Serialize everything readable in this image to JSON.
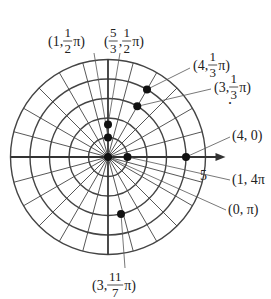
{
  "diagram": {
    "type": "polar-grid",
    "center": {
      "x": 108,
      "y": 157
    },
    "unit_px": 19.5,
    "rings": [
      1,
      2,
      3,
      4,
      5
    ],
    "ray_step_deg": 15,
    "axis_label": "5",
    "colors": {
      "grid": "#444444",
      "axis": "#333333",
      "point": "#111111",
      "text": "#222222"
    }
  },
  "points": [
    {
      "id": "p-1-half-pi",
      "r": 1,
      "theta_deg": 90,
      "label_parts": [
        "(1, ",
        "1",
        "2",
        " π)"
      ],
      "label_x": 48,
      "label_y": 46,
      "anchor": "start",
      "leader_from": [
        94,
        53
      ]
    },
    {
      "id": "p-5-3-half-pi",
      "r": 1.6667,
      "theta_deg": 90,
      "label_parts": [
        "(",
        "5",
        "3",
        ", ",
        "1",
        "2",
        "π)"
      ],
      "label_x": 104,
      "label_y": 46,
      "anchor": "start",
      "leader_from": [
        120,
        53
      ]
    },
    {
      "id": "p-4-third-pi",
      "r": 4,
      "theta_deg": 60,
      "label_parts": [
        "(4, ",
        "1",
        "3",
        "π)"
      ],
      "label_x": 193,
      "label_y": 70,
      "anchor": "start",
      "leader_from": [
        190,
        68
      ]
    },
    {
      "id": "p-3-third-pi",
      "r": 3,
      "theta_deg": 60,
      "label_parts": [
        "(3, ",
        "1",
        "3",
        "π)"
      ],
      "label_x": 214,
      "label_y": 92,
      "anchor": "start",
      "leader_from": [
        211,
        89
      ]
    },
    {
      "id": "p-4-0",
      "r": 4,
      "theta_deg": 0,
      "label_parts": [
        "(4, 0)"
      ],
      "label_x": 232,
      "label_y": 140,
      "anchor": "start",
      "leader_from": [
        230,
        137
      ]
    },
    {
      "id": "p-1-4pi",
      "r": 1,
      "theta_deg": 0,
      "label_parts": [
        "(1, 4π"
      ],
      "label_x": 232,
      "label_y": 184,
      "anchor": "start",
      "leader_from": [
        230,
        180
      ]
    },
    {
      "id": "p-0-pi",
      "r": 0,
      "theta_deg": 180,
      "label_parts": [
        "(0, π)"
      ],
      "label_x": 228,
      "label_y": 214,
      "anchor": "start",
      "leader_from": [
        226,
        210
      ]
    },
    {
      "id": "p-3-11-7-pi",
      "r": 3,
      "theta_deg": 282.857,
      "label_parts": [
        "(3, ",
        "11",
        "7",
        " π)"
      ],
      "label_x": 92,
      "label_y": 290,
      "anchor": "start",
      "leader_from": [
        125,
        268
      ]
    }
  ],
  "extra_marks": [
    {
      "text": ".",
      "x": 228,
      "y": 104
    }
  ],
  "axis_tick_label": {
    "text": "5",
    "x": 200,
    "y": 180
  }
}
